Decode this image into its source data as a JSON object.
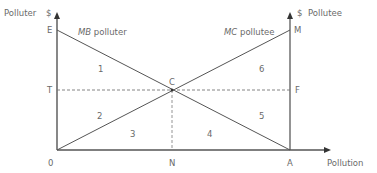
{
  "diagram": {
    "axes": {
      "left_axis_label": "Polluter",
      "left_axis_unit": "$",
      "right_axis_unit": "$",
      "right_axis_label": "Pollutee",
      "x_axis_label": "Pollution"
    },
    "points": {
      "E": "E",
      "T": "T",
      "O": "0",
      "N": "N",
      "A": "A",
      "M": "M",
      "F": "F",
      "C": "C"
    },
    "curves": {
      "mb": {
        "italic": "MB",
        "rest": " polluter"
      },
      "mc": {
        "italic": "MC",
        "rest": " pollutee"
      }
    },
    "regions": [
      "1",
      "2",
      "3",
      "4",
      "5",
      "6"
    ],
    "colors": {
      "line": "#555555",
      "text": "#6a6a6a",
      "dashed": "#777777"
    }
  }
}
